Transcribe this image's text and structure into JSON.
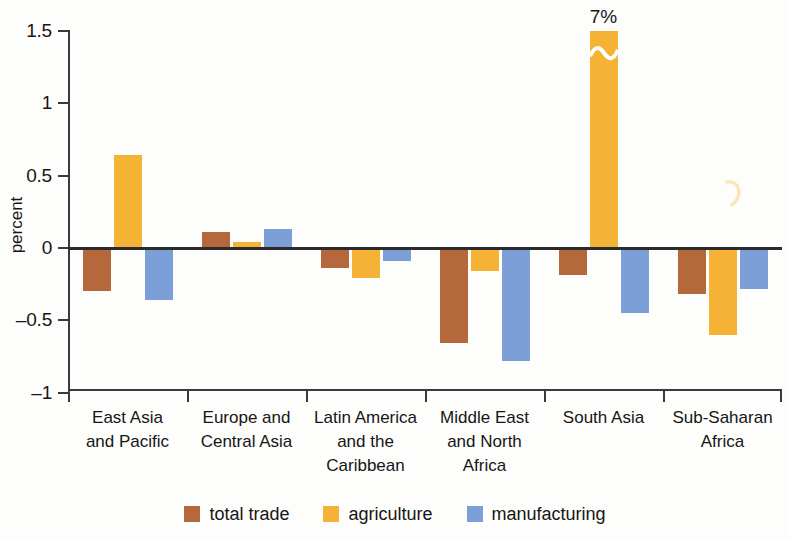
{
  "chart_data": {
    "type": "bar",
    "title": "",
    "subtitle": "",
    "xlabel": "",
    "ylabel": "percent",
    "ylim": [
      -1,
      1.5
    ],
    "ytick_values": [
      1.5,
      1,
      0.5,
      0,
      -0.5,
      -1
    ],
    "ytick_labels": [
      "1.5",
      "1",
      "0.5",
      "0",
      "–0.5",
      "–1"
    ],
    "grid": false,
    "legend_position": "bottom",
    "categories": [
      "East Asia and Pacific",
      "Europe and Central Asia",
      "Latin America and the Caribbean",
      "Middle East and North Africa",
      "South Asia",
      "Sub-Saharan Africa"
    ],
    "category_label_lines": [
      [
        "East Asia",
        "and Pacific"
      ],
      [
        "Europe and",
        "Central Asia"
      ],
      [
        "Latin America",
        "and the",
        "Caribbean"
      ],
      [
        "Middle East",
        "and North",
        "Africa"
      ],
      [
        "South Asia"
      ],
      [
        "Sub-Saharan",
        "Africa"
      ]
    ],
    "series": [
      {
        "name": "total trade",
        "color": "#b5683c",
        "values": [
          -0.3,
          0.11,
          -0.14,
          -0.66,
          -0.19,
          -0.32
        ]
      },
      {
        "name": "agriculture",
        "color": "#f5b335",
        "values": [
          0.64,
          0.04,
          -0.21,
          -0.16,
          7.0,
          -0.6
        ]
      },
      {
        "name": "manufacturing",
        "color": "#7c9fd8",
        "values": [
          -0.36,
          0.13,
          -0.09,
          -0.78,
          -0.45,
          -0.28
        ]
      }
    ],
    "annotations": [
      {
        "text": "7%",
        "category": "South Asia",
        "series": "agriculture",
        "note": "value exceeds axis; bar drawn with axis break"
      }
    ],
    "axis_break": {
      "series": "agriculture",
      "category": "South Asia",
      "style": "squiggle"
    }
  },
  "legend": {
    "items": [
      {
        "label": "total trade",
        "color": "#b5683c"
      },
      {
        "label": "agriculture",
        "color": "#f5b335"
      },
      {
        "label": "manufacturing",
        "color": "#7c9fd8"
      }
    ]
  }
}
